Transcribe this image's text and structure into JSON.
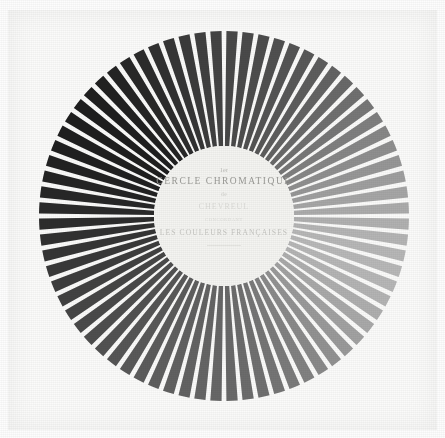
{
  "figure": {
    "kind": "color-wheel-plate",
    "caption_present": false,
    "background_color": "#fdfdfd",
    "paper_color": "#fbfbfa"
  },
  "hub": {
    "line_ordinal": "1er",
    "line_title": "CERCLE CHROMATIQUE",
    "line_de": "de",
    "line_author": "CHEVREUL",
    "line_sub": "CONCORDANT",
    "line_bottom": "LES COULEURS FRANÇAISES",
    "disc_color": "#f4f4f1",
    "text_color": "#9a9a96"
  },
  "chart_data": {
    "type": "pie",
    "title": "1er CERCLE CHROMATIQUE",
    "subtitle": "LES COULEURS FRANÇAISES",
    "xlabel": "",
    "ylabel": "",
    "grid": false,
    "legend_position": "none",
    "geometry": {
      "center_x": 224,
      "center_y": 216,
      "outer_radius": 185,
      "inner_radius": 70,
      "spoke_count": 72,
      "gap_degrees": 1.5,
      "start_angle_degrees": -90
    },
    "categories": [
      "s01",
      "s02",
      "s03",
      "s04",
      "s05",
      "s06",
      "s07",
      "s08",
      "s09",
      "s10",
      "s11",
      "s12",
      "s13",
      "s14",
      "s15",
      "s16",
      "s17",
      "s18",
      "s19",
      "s20",
      "s21",
      "s22",
      "s23",
      "s24",
      "s25",
      "s26",
      "s27",
      "s28",
      "s29",
      "s30",
      "s31",
      "s32",
      "s33",
      "s34",
      "s35",
      "s36",
      "s37",
      "s38",
      "s39",
      "s40",
      "s41",
      "s42",
      "s43",
      "s44",
      "s45",
      "s46",
      "s47",
      "s48",
      "s49",
      "s50",
      "s51",
      "s52",
      "s53",
      "s54",
      "s55",
      "s56",
      "s57",
      "s58",
      "s59",
      "s60",
      "s61",
      "s62",
      "s63",
      "s64",
      "s65",
      "s66",
      "s67",
      "s68",
      "s69",
      "s70",
      "s71",
      "s72"
    ],
    "values": [
      72,
      74,
      77,
      80,
      84,
      88,
      93,
      99,
      105,
      112,
      119,
      127,
      135,
      143,
      151,
      159,
      166,
      172,
      177,
      181,
      183,
      184,
      183,
      180,
      175,
      169,
      162,
      154,
      146,
      138,
      130,
      123,
      117,
      112,
      108,
      105,
      103,
      101,
      99,
      97,
      95,
      92,
      89,
      86,
      82,
      78,
      74,
      70,
      66,
      61,
      57,
      53,
      49,
      45,
      42,
      39,
      36,
      34,
      32,
      31,
      30,
      30,
      31,
      33,
      36,
      40,
      44,
      49,
      54,
      59,
      64,
      68
    ],
    "series": [
      {
        "name": "spoke-luminance",
        "values": [
          72,
          74,
          77,
          80,
          84,
          88,
          93,
          99,
          105,
          112,
          119,
          127,
          135,
          143,
          151,
          159,
          166,
          172,
          177,
          181,
          183,
          184,
          183,
          180,
          175,
          169,
          162,
          154,
          146,
          138,
          130,
          123,
          117,
          112,
          108,
          105,
          103,
          101,
          99,
          97,
          95,
          92,
          89,
          86,
          82,
          78,
          74,
          70,
          66,
          61,
          57,
          53,
          49,
          45,
          42,
          39,
          36,
          34,
          32,
          31,
          30,
          30,
          31,
          33,
          36,
          40,
          44,
          49,
          54,
          59,
          64,
          68
        ]
      }
    ],
    "value_range": [
      30,
      184
    ],
    "annotations": [
      "lightest sector at upper-right (approx. 1-2 o'clock)",
      "darkest sector at lower-left (approx. 7-8 o'clock)"
    ]
  }
}
